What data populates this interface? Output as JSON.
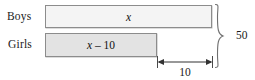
{
  "diagram": {
    "background_color": "#ffffff",
    "line_color": "#8c8c8c",
    "text_color": "#1a1a1a"
  },
  "rows": [
    {
      "label": "Boys",
      "bar_text": "x",
      "bar_text_italic": "x",
      "bar_fill": "#f4f4f4",
      "bar_width_px": 167
    },
    {
      "label": "Girls",
      "bar_text": "x – 10",
      "bar_text_italic": "x",
      "bar_text_rest": " – 10",
      "bar_fill": "#e3e3e3",
      "bar_width_px": 112
    }
  ],
  "annotations": {
    "total_brace_label": "50",
    "difference_arrow_label": "10"
  }
}
